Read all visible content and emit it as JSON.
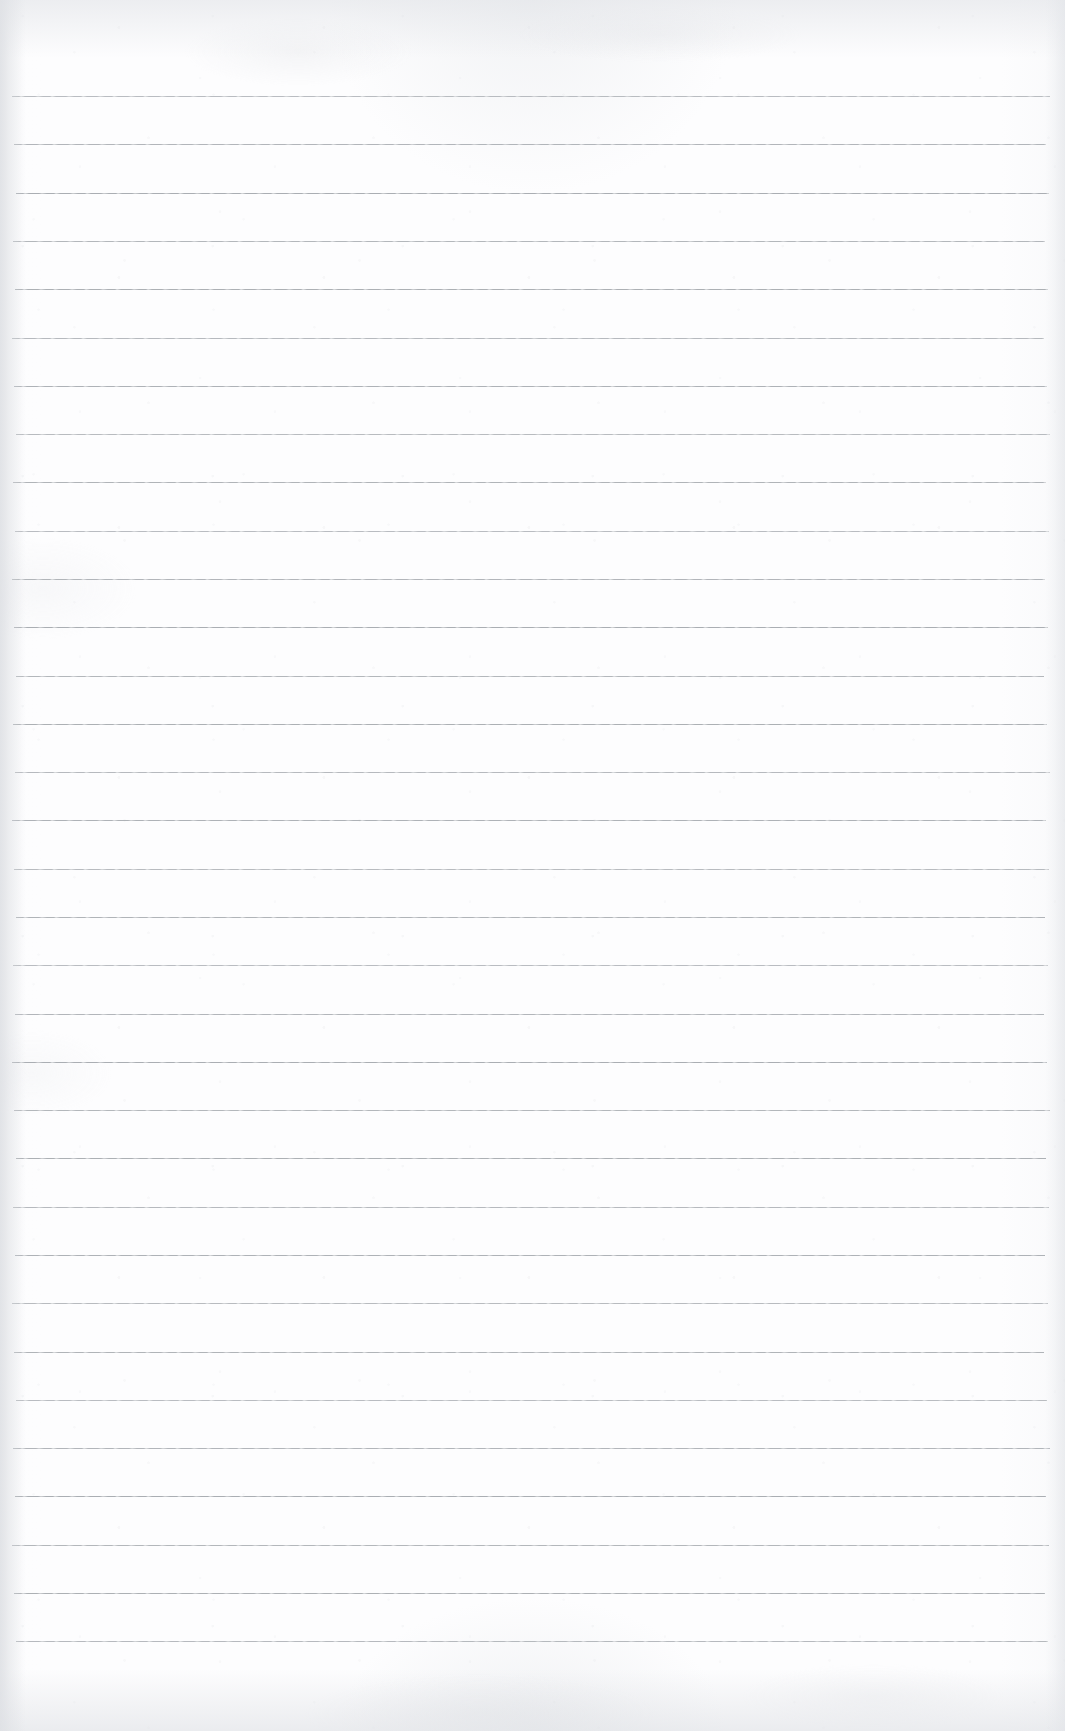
{
  "document": {
    "kind": "lined-notebook-paper-scan",
    "orientation": "portrait",
    "text_content": "",
    "annotations": [],
    "page_width_px": 1065,
    "page_height_px": 1731
  },
  "colors": {
    "paper_background": "#fdfdfe",
    "rule_line": "#a9adb2",
    "edge_shadow": "#e2e4e8"
  },
  "ruling": {
    "style": "wide-ruled",
    "line_count": 33,
    "first_line_y": 96,
    "line_spacing_px": 48.3,
    "line_start_x": 12,
    "line_end_x": 1050,
    "line_thickness_px": 1,
    "margin_line": false,
    "header_line": false,
    "lines_y": [
      96,
      144,
      193,
      241,
      289,
      338,
      386,
      434,
      482,
      531,
      579,
      627,
      676,
      724,
      772,
      820,
      869,
      917,
      965,
      1014,
      1062,
      1110,
      1158,
      1207,
      1255,
      1303,
      1352,
      1400,
      1448,
      1496,
      1545,
      1593,
      1641
    ]
  }
}
